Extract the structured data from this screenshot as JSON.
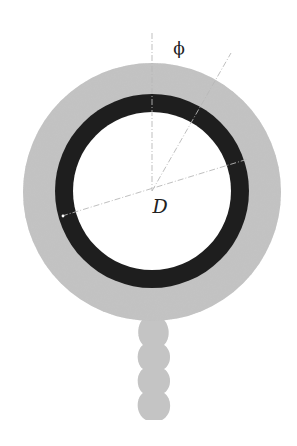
{
  "diagram": {
    "labels": {
      "angle": "ϕ",
      "diameter": "D"
    },
    "geometry": {
      "center": [
        152,
        191
      ],
      "outer_layer_radius": 129,
      "ring_outer_radius": 97,
      "ring_inner_radius": 79,
      "stem_lobes": 4
    },
    "colors": {
      "outer_layer": "#c2c2c2",
      "ring": "#1e1e1e",
      "interior": "#ffffff",
      "guide_lines": "#b8b8b8",
      "text": "#222222"
    }
  }
}
